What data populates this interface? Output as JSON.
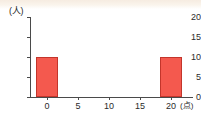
{
  "chart_data": {
    "type": "bar",
    "title": "",
    "subtitle": "",
    "xlabel": "(点)",
    "ylabel": "(人)",
    "x": [
      0,
      5,
      10,
      15,
      20
    ],
    "categories": [
      "0",
      "5",
      "10",
      "15",
      "20"
    ],
    "values": [
      10,
      0,
      0,
      0,
      10
    ],
    "series": [
      {
        "name": "人数",
        "values": [
          10,
          0,
          0,
          0,
          10
        ]
      }
    ],
    "xlim": [
      -2.5,
      26
    ],
    "ylim": [
      0,
      20
    ],
    "yticks": [
      0,
      5,
      10,
      15,
      20
    ],
    "ytick_labels": [
      "0",
      "5",
      "10",
      "15",
      "20"
    ],
    "xticks": [
      0,
      5,
      10,
      15,
      20
    ],
    "xtick_labels": [
      "0",
      "5",
      "10",
      "15",
      "20"
    ],
    "grid": false,
    "legend": false,
    "legend_position": "none",
    "bar_fill_color": "#f4594e",
    "bar_edge_color": "#c3352b",
    "axis_color": "#4a4a4a",
    "background_color": "#ffffff",
    "annotations": []
  },
  "axes": {
    "y_unit_caption": "(人)",
    "x_unit_caption": "(点)"
  }
}
